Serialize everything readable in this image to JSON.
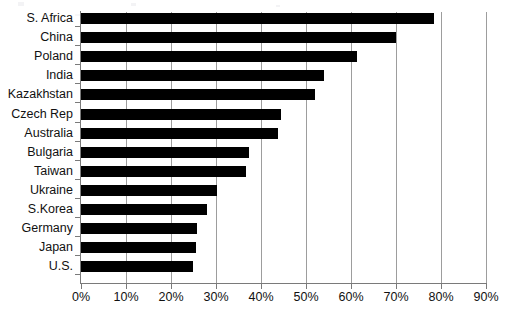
{
  "chart_data": {
    "type": "bar",
    "orientation": "horizontal",
    "title": "",
    "subtitle": "",
    "xlabel": "",
    "ylabel": "",
    "xlim": [
      0,
      90
    ],
    "xticks": [
      0,
      10,
      20,
      30,
      40,
      50,
      60,
      70,
      80,
      90
    ],
    "xtick_labels": [
      "0%",
      "10%",
      "20%",
      "30%",
      "40%",
      "50%",
      "60%",
      "70%",
      "80%",
      "90%"
    ],
    "grid": "vertical",
    "legend": "none",
    "bar_color": "#000000",
    "grid_color": "#9d9d9d",
    "axis_color": "#7a7a7a",
    "categories": [
      "S. Africa",
      "China",
      "Poland",
      "India",
      "Kazakhstan",
      "Czech Rep",
      "Australia",
      "Bulgaria",
      "Taiwan",
      "Ukraine",
      "S.Korea",
      "Germany",
      "Japan",
      "U.S."
    ],
    "values": [
      78.5,
      70.0,
      61.3,
      54.0,
      52.0,
      44.5,
      43.8,
      37.4,
      36.7,
      30.2,
      27.9,
      25.8,
      25.5,
      24.8
    ],
    "value_labels": [
      "78.5%",
      "70.0%",
      "61.3%",
      "54.0%",
      "52.0%",
      "44.5%",
      "43.8%",
      "37.4%",
      "36.7%",
      "30.2%",
      "27.9%",
      "25.8%",
      "25.5%",
      "24.8%"
    ]
  }
}
